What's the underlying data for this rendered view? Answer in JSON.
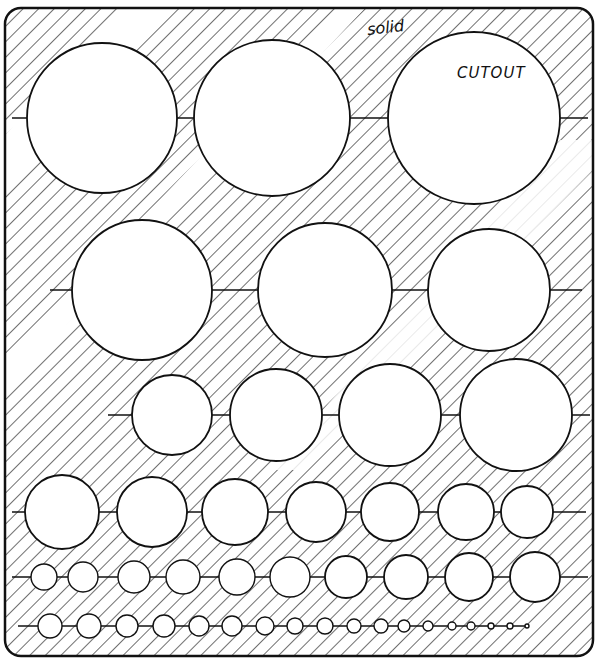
{
  "diagram": {
    "type": "circle-template-stencil",
    "labels": {
      "solid": "solid",
      "cutout": "CUTOUT"
    },
    "colors": {
      "stroke": "#111111",
      "background": "#ffffff",
      "hatch": "#222222"
    },
    "frame": {
      "x": 5,
      "y": 8,
      "width": 588,
      "height": 648,
      "corner_radius": 16
    },
    "rows": [
      {
        "y": 118,
        "line_x1": 12,
        "line_x2": 588,
        "circles": [
          {
            "cx": 102,
            "r": 75
          },
          {
            "cx": 272,
            "r": 78
          },
          {
            "cx": 474,
            "r": 86
          }
        ]
      },
      {
        "y": 290,
        "line_x1": 50,
        "line_x2": 582,
        "circles": [
          {
            "cx": 142,
            "r": 70
          },
          {
            "cx": 325,
            "r": 67
          },
          {
            "cx": 489,
            "r": 61
          }
        ]
      },
      {
        "y": 415,
        "line_x1": 108,
        "line_x2": 590,
        "circles": [
          {
            "cx": 172,
            "r": 40
          },
          {
            "cx": 276,
            "r": 46
          },
          {
            "cx": 390,
            "r": 51
          },
          {
            "cx": 516,
            "r": 56
          }
        ]
      },
      {
        "y": 512,
        "line_x1": 12,
        "line_x2": 586,
        "circles": [
          {
            "cx": 62,
            "r": 37
          },
          {
            "cx": 152,
            "r": 35
          },
          {
            "cx": 235,
            "r": 33
          },
          {
            "cx": 316,
            "r": 30
          },
          {
            "cx": 390,
            "r": 29
          },
          {
            "cx": 466,
            "r": 28
          },
          {
            "cx": 527,
            "r": 26
          }
        ]
      },
      {
        "y": 577,
        "line_x1": 12,
        "line_x2": 588,
        "circles": [
          {
            "cx": 44,
            "r": 13
          },
          {
            "cx": 83,
            "r": 15
          },
          {
            "cx": 134,
            "r": 16
          },
          {
            "cx": 183,
            "r": 17
          },
          {
            "cx": 237,
            "r": 18
          },
          {
            "cx": 290,
            "r": 20
          },
          {
            "cx": 346,
            "r": 21
          },
          {
            "cx": 406,
            "r": 22
          },
          {
            "cx": 469,
            "r": 24
          },
          {
            "cx": 535,
            "r": 25
          }
        ]
      },
      {
        "y": 626,
        "line_x1": 18,
        "line_x2": 527,
        "circles": [
          {
            "cx": 50,
            "r": 12
          },
          {
            "cx": 89,
            "r": 12
          },
          {
            "cx": 127,
            "r": 11
          },
          {
            "cx": 164,
            "r": 11
          },
          {
            "cx": 199,
            "r": 10
          },
          {
            "cx": 232,
            "r": 10
          },
          {
            "cx": 265,
            "r": 9
          },
          {
            "cx": 295,
            "r": 8
          },
          {
            "cx": 325,
            "r": 8
          },
          {
            "cx": 354,
            "r": 7
          },
          {
            "cx": 381,
            "r": 7
          },
          {
            "cx": 404,
            "r": 6
          },
          {
            "cx": 428,
            "r": 5
          },
          {
            "cx": 452,
            "r": 4
          },
          {
            "cx": 471,
            "r": 4
          },
          {
            "cx": 491,
            "r": 3
          },
          {
            "cx": 510,
            "r": 3
          },
          {
            "cx": 527,
            "r": 2
          }
        ]
      }
    ]
  }
}
